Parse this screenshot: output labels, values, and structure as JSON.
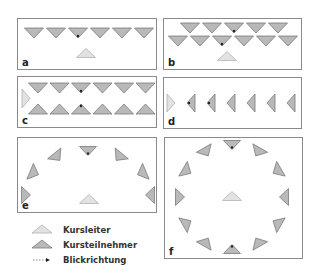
{
  "panels": [
    {
      "id": "a",
      "label": "a",
      "arrangement": "single row facing leader",
      "rows": [
        {
          "count": 6,
          "facing": "down"
        }
      ],
      "leader": "front-center",
      "gaze_marks": [
        {
          "row": 0,
          "index": 2
        }
      ]
    },
    {
      "id": "b",
      "label": "b",
      "arrangement": "two staggered rows facing leader",
      "rows": [
        {
          "count": 5,
          "facing": "down"
        },
        {
          "count": 6,
          "facing": "down"
        }
      ],
      "leader": "front-center",
      "gaze_marks": [
        {
          "row": 0,
          "index": 2
        },
        {
          "row": 1,
          "index": 2
        }
      ]
    },
    {
      "id": "c",
      "label": "c",
      "arrangement": "two facing rows, leader at side",
      "rows": [
        {
          "count": 6,
          "facing": "down"
        },
        {
          "count": 6,
          "facing": "up"
        }
      ],
      "leader": "left-side",
      "gaze_marks": [
        {
          "row": 0,
          "index": 2
        },
        {
          "row": 1,
          "index": 2
        }
      ]
    },
    {
      "id": "d",
      "label": "d",
      "arrangement": "single file facing leader",
      "rows": [
        {
          "count": 6,
          "facing": "left"
        }
      ],
      "leader": "left-side",
      "gaze_marks": [
        {
          "row": 0,
          "index": 0
        },
        {
          "row": 0,
          "index": 1
        }
      ]
    },
    {
      "id": "e",
      "label": "e",
      "arrangement": "horseshoe / semicircle",
      "participants": 7,
      "leader": "center-bottom",
      "gaze_marks": [
        {
          "index": 3
        }
      ]
    },
    {
      "id": "f",
      "label": "f",
      "arrangement": "full circle",
      "participants": 12,
      "leader": "center",
      "gaze_marks": [
        {
          "index": 0
        },
        {
          "index": 6
        }
      ]
    }
  ],
  "legend": {
    "items": [
      {
        "symbol": "leader-triangle",
        "label": "Kursleiter"
      },
      {
        "symbol": "participant-triangle",
        "label": "Kursteilnehmer"
      },
      {
        "symbol": "gaze-arrow",
        "label": "Blickrichtung"
      }
    ]
  },
  "colors": {
    "participant_fill": "#b9b9b9",
    "participant_stroke": "#7a7a7a",
    "leader_fill": "#e2e2e2",
    "leader_stroke": "#b2b2b2",
    "box_stroke": "#8a8a8a"
  }
}
